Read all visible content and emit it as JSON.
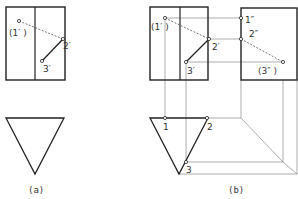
{
  "figure_a": {
    "caption": "(a)",
    "labels": {
      "p1": "(1′ )",
      "p2": "2′",
      "p3": "3′"
    }
  },
  "figure_b": {
    "caption": "(b)",
    "front_labels": {
      "p1": "(1′ )",
      "p2": "2′",
      "p3": "3′"
    },
    "side_labels": {
      "p1": "1″",
      "p2": "2″",
      "p3": "(3″ )"
    },
    "top_labels": {
      "p1": "1",
      "p2": "2",
      "p3": "3"
    }
  },
  "colors": {
    "stroke": "#222222",
    "thin": "#666666",
    "background": "#ffffff"
  }
}
